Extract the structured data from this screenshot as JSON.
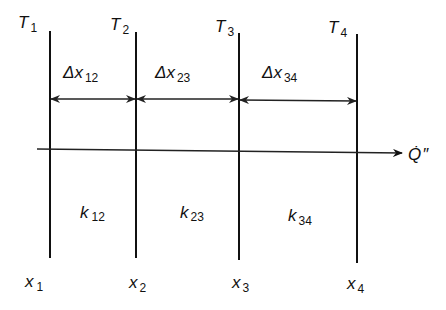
{
  "diagram": {
    "type": "multilayer-wall-heat-conduction",
    "colors": {
      "ink": "#111111",
      "background": "#ffffff"
    },
    "interfaces": [
      {
        "temp_label": "T",
        "temp_sub": "1",
        "pos_label": "x",
        "pos_sub": "1"
      },
      {
        "temp_label": "T",
        "temp_sub": "2",
        "pos_label": "x",
        "pos_sub": "2"
      },
      {
        "temp_label": "T",
        "temp_sub": "3",
        "pos_label": "x",
        "pos_sub": "3"
      },
      {
        "temp_label": "T",
        "temp_sub": "4",
        "pos_label": "x",
        "pos_sub": "4"
      }
    ],
    "layers": [
      {
        "thickness_label": "Δx",
        "thickness_sub": "12",
        "conductivity_label": "k",
        "conductivity_sub": "12"
      },
      {
        "thickness_label": "Δx",
        "thickness_sub": "23",
        "conductivity_label": "k",
        "conductivity_sub": "23"
      },
      {
        "thickness_label": "Δx",
        "thickness_sub": "34",
        "conductivity_label": "k",
        "conductivity_sub": "34"
      }
    ],
    "heat_flux": {
      "label": "Q̇",
      "prime": "″"
    }
  }
}
